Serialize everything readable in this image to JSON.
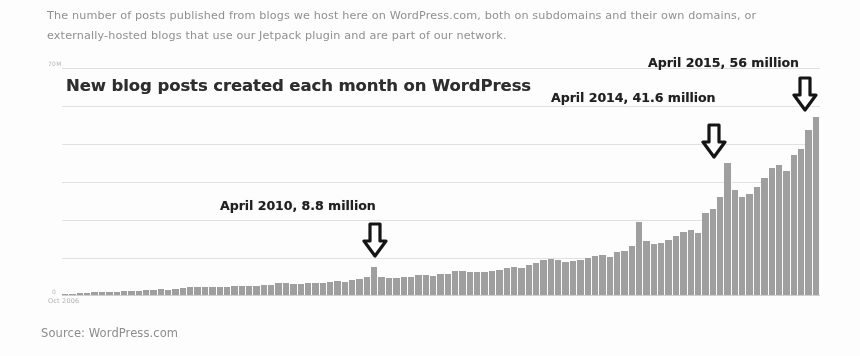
{
  "caption": {
    "line1": "The number of posts published from blogs we host here on WordPress.com, both on subdomains and their own domains, or",
    "line2": "externally-hosted blogs that use our Jetpack plugin and are part of our network."
  },
  "source": "Source: WordPress.com",
  "annotations": [
    {
      "label": "April 2010, 8.8 million",
      "arrow_icon": "down-arrow-icon"
    },
    {
      "label": "April 2014, 41.6 million",
      "arrow_icon": "down-arrow-icon"
    },
    {
      "label": "April 2015, 56 million",
      "arrow_icon": "down-arrow-icon"
    }
  ],
  "chart_data": {
    "type": "bar",
    "title": "New blog posts created each month on WordPress",
    "xlabel": "",
    "ylabel": "",
    "ylim": [
      0,
      70
    ],
    "ytick_top_label": "70M",
    "ytick_zero_label": "0",
    "xtick_start_label": "Oct 2006",
    "grid": true,
    "gridline_count": 6,
    "legend": "none",
    "bar_color": "#9e9e9e",
    "units": "millions of posts per month",
    "x_start": "Oct 2006",
    "x_end": "Apr 2015",
    "annotated_points": [
      {
        "x": "April 2010",
        "y": 8.8
      },
      {
        "x": "April 2014",
        "y": 41.6
      },
      {
        "x": "April 2015",
        "y": 56
      }
    ],
    "categories": [
      "Oct 2006",
      "Nov 2006",
      "Dec 2006",
      "Jan 2007",
      "Feb 2007",
      "Mar 2007",
      "Apr 2007",
      "May 2007",
      "Jun 2007",
      "Jul 2007",
      "Aug 2007",
      "Sep 2007",
      "Oct 2007",
      "Nov 2007",
      "Dec 2007",
      "Jan 2008",
      "Feb 2008",
      "Mar 2008",
      "Apr 2008",
      "May 2008",
      "Jun 2008",
      "Jul 2008",
      "Aug 2008",
      "Sep 2008",
      "Oct 2008",
      "Nov 2008",
      "Dec 2008",
      "Jan 2009",
      "Feb 2009",
      "Mar 2009",
      "Apr 2009",
      "May 2009",
      "Jun 2009",
      "Jul 2009",
      "Aug 2009",
      "Sep 2009",
      "Oct 2009",
      "Nov 2009",
      "Dec 2009",
      "Jan 2010",
      "Feb 2010",
      "Mar 2010",
      "Apr 2010",
      "May 2010",
      "Jun 2010",
      "Jul 2010",
      "Aug 2010",
      "Sep 2010",
      "Oct 2010",
      "Nov 2010",
      "Dec 2010",
      "Jan 2011",
      "Feb 2011",
      "Mar 2011",
      "Apr 2011",
      "May 2011",
      "Jun 2011",
      "Jul 2011",
      "Aug 2011",
      "Sep 2011",
      "Oct 2011",
      "Nov 2011",
      "Dec 2011",
      "Jan 2012",
      "Feb 2012",
      "Mar 2012",
      "Apr 2012",
      "May 2012",
      "Jun 2012",
      "Jul 2012",
      "Aug 2012",
      "Sep 2012",
      "Oct 2012",
      "Nov 2012",
      "Dec 2012",
      "Jan 2013",
      "Feb 2013",
      "Mar 2013",
      "Apr 2013",
      "May 2013",
      "Jun 2013",
      "Jul 2013",
      "Aug 2013",
      "Sep 2013",
      "Oct 2013",
      "Nov 2013",
      "Dec 2013",
      "Jan 2014",
      "Feb 2014",
      "Mar 2014",
      "Apr 2014",
      "May 2014",
      "Jun 2014",
      "Jul 2014",
      "Aug 2014",
      "Sep 2014",
      "Oct 2014",
      "Nov 2014",
      "Dec 2014",
      "Jan 2015",
      "Feb 2015",
      "Mar 2015",
      "Apr 2015"
    ],
    "values": [
      0.3,
      0.4,
      0.5,
      0.7,
      0.8,
      1.0,
      1.0,
      1.1,
      1.2,
      1.3,
      1.4,
      1.5,
      1.7,
      1.8,
      1.7,
      2.0,
      2.1,
      2.4,
      2.4,
      2.5,
      2.4,
      2.6,
      2.6,
      2.8,
      3.0,
      3.0,
      2.8,
      3.3,
      3.3,
      3.7,
      3.7,
      3.6,
      3.6,
      3.7,
      3.8,
      3.9,
      4.2,
      4.3,
      4.1,
      4.8,
      4.9,
      5.6,
      8.8,
      5.6,
      5.4,
      5.5,
      5.6,
      5.8,
      6.2,
      6.3,
      6.0,
      6.6,
      6.7,
      7.5,
      7.6,
      7.4,
      7.2,
      7.3,
      7.6,
      7.9,
      8.6,
      8.8,
      8.4,
      9.6,
      10.0,
      11.0,
      11.2,
      11.0,
      10.4,
      10.6,
      11.0,
      11.6,
      12.4,
      12.6,
      12.0,
      13.6,
      14.0,
      15.6,
      23.0,
      17.0,
      16.0,
      16.4,
      17.2,
      18.6,
      20.0,
      20.4,
      19.4,
      26.0,
      27.0,
      31.0,
      41.6,
      33.0,
      31.0,
      32.0,
      34.0,
      37.0,
      40.0,
      41.0,
      39.0,
      44.0,
      46.0,
      52.0,
      56.0
    ]
  }
}
